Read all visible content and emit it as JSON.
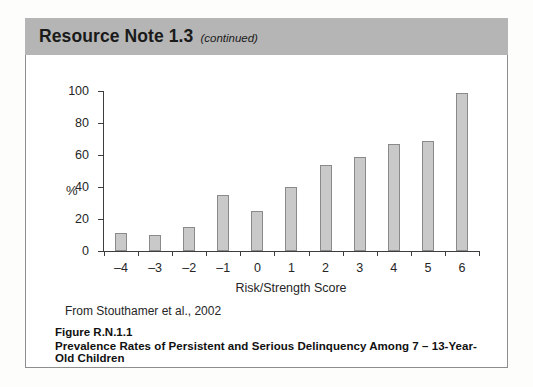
{
  "header": {
    "title": "Resource Note 1.3",
    "continued": "(continued)"
  },
  "source_note": "From Stouthamer et al., 2002",
  "figure": {
    "number": "Figure R.N.1.1",
    "title": "Prevalence Rates of Persistent and Serious Delinquency Among 7 – 13-Year-Old Children"
  },
  "chart_data": {
    "type": "bar",
    "title": "",
    "xlabel": "Risk/Strength Score",
    "ylabel": "%",
    "categories": [
      "–4",
      "–3",
      "–2",
      "–1",
      "0",
      "1",
      "2",
      "3",
      "4",
      "5",
      "6"
    ],
    "values": [
      11,
      10,
      15,
      35,
      25,
      40,
      54,
      59,
      67,
      69,
      99
    ],
    "ylim": [
      0,
      100
    ],
    "yticks": [
      0,
      20,
      40,
      60,
      80,
      100
    ],
    "ytick_labels": [
      "0",
      "20",
      "40",
      "60",
      "80",
      "100"
    ],
    "grid": false,
    "legend": "none",
    "bar_color": "#c9c9c9",
    "bar_edge_color": "#8a8a8a",
    "axis_color": "#3d3d3d"
  },
  "colors": {
    "header_band": "#b5b5b5",
    "panel_background": "#ffffff",
    "panel_border": "#8e8e8e",
    "page_background": "#fdfdfc",
    "text": "#1a1a1a"
  }
}
